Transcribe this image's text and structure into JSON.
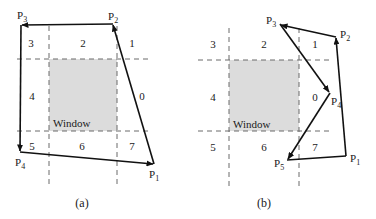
{
  "colors": {
    "window_fill": "#dcdcdc",
    "dash": "#6a6a6a",
    "polygon": "#111111",
    "text": "#1a1a1a"
  },
  "panels": [
    {
      "id": "a",
      "caption": "(a)",
      "window_label": "Window",
      "regions": [
        "0",
        "1",
        "2",
        "3",
        "4",
        "5",
        "6",
        "7"
      ],
      "points": [
        {
          "name": "P",
          "sub": "1"
        },
        {
          "name": "P",
          "sub": "2"
        },
        {
          "name": "P",
          "sub": "3"
        },
        {
          "name": "P",
          "sub": "4"
        }
      ]
    },
    {
      "id": "b",
      "caption": "(b)",
      "window_label": "Window",
      "regions": [
        "0",
        "1",
        "2",
        "3",
        "4",
        "5",
        "6",
        "7"
      ],
      "points": [
        {
          "name": "P",
          "sub": "1"
        },
        {
          "name": "P",
          "sub": "2"
        },
        {
          "name": "P",
          "sub": "3"
        },
        {
          "name": "P",
          "sub": "4"
        },
        {
          "name": "P",
          "sub": "5"
        }
      ]
    }
  ]
}
